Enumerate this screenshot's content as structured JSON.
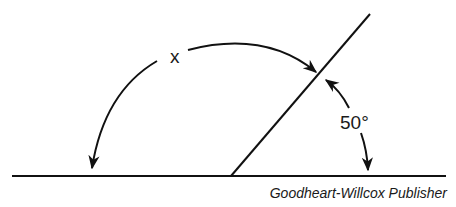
{
  "diagram": {
    "angle_x_label": "x",
    "angle_known_label": "50°",
    "credit": "Goodheart-Willcox Publisher"
  }
}
